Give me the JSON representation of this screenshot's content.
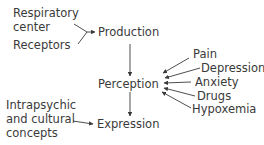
{
  "diagram": {
    "nodes": {
      "respiratory_center": [
        "Respiratory",
        "center"
      ],
      "receptors": "Receptors",
      "production": "Production",
      "perception": "Perception",
      "expression": "Expression",
      "intrapsychic": [
        "Intrapsychic",
        "and cultural",
        "concepts"
      ],
      "pain": "Pain",
      "depression": "Depression",
      "anxiety": "Anxiety",
      "drugs": "Drugs",
      "hypoxemia": "Hypoxemia"
    },
    "edges": [
      {
        "from": "Respiratory center",
        "to": "Production"
      },
      {
        "from": "Receptors",
        "to": "Production"
      },
      {
        "from": "Production",
        "to": "Perception"
      },
      {
        "from": "Pain",
        "to": "Perception"
      },
      {
        "from": "Depression",
        "to": "Perception"
      },
      {
        "from": "Anxiety",
        "to": "Perception"
      },
      {
        "from": "Drugs",
        "to": "Perception"
      },
      {
        "from": "Hypoxemia",
        "to": "Perception"
      },
      {
        "from": "Perception",
        "to": "Expression"
      },
      {
        "from": "Intrapsychic and cultural concepts",
        "to": "Expression"
      }
    ],
    "colors": {
      "text": "#3a3a3a",
      "line": "#3a3a3a",
      "background": "#ffffff"
    }
  }
}
